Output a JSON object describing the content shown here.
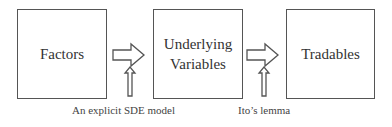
{
  "boxes": [
    {
      "label": "Factors"
    },
    {
      "label_line1": "Underlying",
      "label_line2": "Variables"
    },
    {
      "label": "Tradables"
    }
  ],
  "annotations": [
    {
      "label": "An explicit SDE model"
    },
    {
      "label": "Ito’s lemma"
    }
  ],
  "colors": {
    "stroke": "#555555",
    "text": "#333333"
  }
}
